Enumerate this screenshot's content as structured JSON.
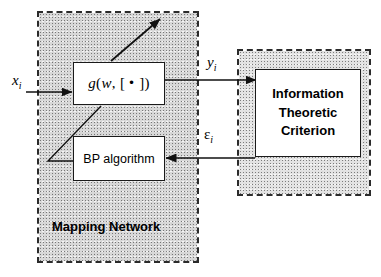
{
  "figure": {
    "type": "block-diagram"
  },
  "regions": [
    {
      "id": "mapping-network",
      "caption": "Mapping Network",
      "border": "dashed",
      "color": "#2b2b2b"
    },
    {
      "id": "information-theoretic-criterion",
      "caption": "",
      "border": "dashed",
      "color": "#2b2b2b"
    }
  ],
  "blocks": {
    "g_function": {
      "expr_g": "g",
      "expr_open": "(",
      "expr_w": "w",
      "expr_comma": ",",
      "expr_bracket_open": "[",
      "expr_dot": "•",
      "expr_bracket_close": "]",
      "expr_close": ")",
      "full_text": "g(w, [ • ])"
    },
    "bp_algorithm": {
      "label": "BP algorithm"
    },
    "criterion": {
      "line1": "Information",
      "line2": "Theoretic",
      "line3": "Criterion"
    }
  },
  "signals": {
    "input": {
      "symbol": "x",
      "subscript": "i",
      "text": "x"
    },
    "output": {
      "symbol": "y",
      "subscript": "i",
      "text": "y"
    },
    "error": {
      "symbol": "ε",
      "subscript": "i",
      "text": "ε"
    }
  },
  "captions": {
    "mapping_network": "Mapping Network"
  },
  "colors": {
    "line": "#1a1a1a",
    "dashed_border": "#2b2b2b",
    "region_fill": "#d8d8d8",
    "box_fill": "#ffffff",
    "text": "#000000"
  }
}
